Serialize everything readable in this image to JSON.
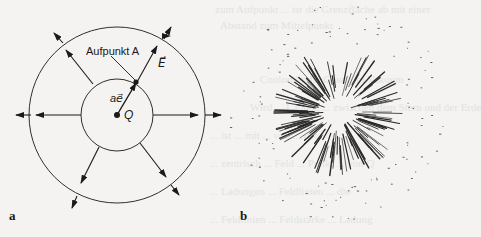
{
  "figure": {
    "panel_a": {
      "letter": "a",
      "label_point": "Aufpunkt A",
      "label_field": "E⃗",
      "label_vector": "ae⃗",
      "label_charge": "Q"
    },
    "panel_b": {
      "letter": "b"
    }
  },
  "bleed_through": {
    "lines": [
      "zum Aufpunkt ... ist die Grenzfläche ab mit einer",
      "Abstand zum Mittelpunkt",
      "Coulombsche Gesetz in Vakuum",
      "Wird ... Ladung ... zwischen dem Stern und der Erde",
      "... ist ... mit ... von ... der",
      "... zentrisch ... Feld ... Punkt ... von Q",
      "... Ladungen ... Feldlinien ... die",
      "... Feldlinien ... Feldstärke ... Ladung"
    ]
  },
  "colors": {
    "ink": "#1a1a1a",
    "paper": "#f4f3f1",
    "bleed": "#e3e2df"
  }
}
